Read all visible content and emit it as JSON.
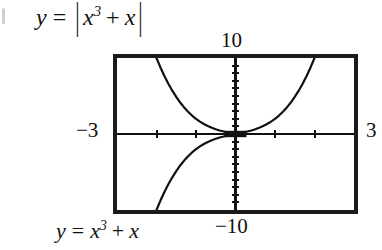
{
  "top_expression": {
    "lhs": "y",
    "equals": "=",
    "open_bar": "|",
    "base": "x",
    "exponent": "3",
    "plus": "+",
    "term": "x",
    "close_bar": "|",
    "plain": "y = |x^3 + x|"
  },
  "bottom_caption": {
    "lhs": "y",
    "equals": "=",
    "base": "x",
    "exponent": "3",
    "plus": "+",
    "term": "x",
    "plain": "y = x^3 + x"
  },
  "window": {
    "ymax_label": "10",
    "ymin_label": "−10",
    "xmin_label": "−3",
    "xmax_label": "3"
  },
  "colors": {
    "frame": "#1a1a1a",
    "axis": "#111111",
    "curve": "#111111",
    "background": "#ffffff"
  },
  "chart_data": {
    "type": "line",
    "subtitle": "y = x^3 + x",
    "xlabel": "",
    "ylabel": "",
    "xlim": [
      -3,
      3
    ],
    "ylim": [
      -10,
      10
    ],
    "grid": false,
    "legend": "none",
    "x_ticks": [
      -3,
      -2,
      -1,
      0,
      1,
      2,
      3
    ],
    "y_ticks": [
      -10,
      -9,
      -8,
      -7,
      -6,
      -5,
      -4,
      -3,
      -2,
      -1,
      0,
      1,
      2,
      3,
      4,
      5,
      6,
      7,
      8,
      9,
      10
    ],
    "x_tick_labels": [
      "−3",
      "",
      "",
      "",
      "",
      "",
      "3"
    ],
    "y_tick_labels": [
      "−10",
      "",
      "",
      "",
      "",
      "",
      "",
      "",
      "",
      "",
      "",
      "",
      "",
      "",
      "",
      "",
      "",
      "",
      "",
      "",
      "10"
    ],
    "series": [
      {
        "name": "y = |x^3 + x|",
        "style": "solid",
        "x": [
          -2.15,
          -2.1,
          -2.0,
          -1.9,
          -1.8,
          -1.7,
          -1.6,
          -1.5,
          -1.4,
          -1.3,
          -1.2,
          -1.1,
          -1.0,
          -0.9,
          -0.8,
          -0.7,
          -0.6,
          -0.5,
          -0.4,
          -0.3,
          -0.2,
          -0.1,
          0.0,
          0.1,
          0.2,
          0.3,
          0.4,
          0.5,
          0.6,
          0.7,
          0.8,
          0.9,
          1.0,
          1.1,
          1.2,
          1.3,
          1.4,
          1.5,
          1.6,
          1.7,
          1.8,
          1.9,
          2.0,
          2.1,
          2.15
        ],
        "values": [
          12.09,
          11.36,
          10.0,
          8.76,
          7.63,
          6.61,
          5.7,
          4.88,
          4.14,
          3.5,
          2.93,
          2.43,
          2.0,
          1.63,
          1.31,
          1.04,
          0.82,
          0.63,
          0.46,
          0.33,
          0.21,
          0.1,
          0.0,
          0.1,
          0.21,
          0.33,
          0.46,
          0.63,
          0.82,
          1.04,
          1.31,
          1.63,
          2.0,
          2.43,
          2.93,
          3.5,
          4.14,
          4.88,
          5.7,
          6.61,
          7.63,
          8.76,
          10.0,
          11.36,
          12.09
        ]
      },
      {
        "name": "y = x^3 + x (negative branch, x < 0)",
        "style": "solid",
        "x": [
          -2.0,
          -1.9,
          -1.8,
          -1.7,
          -1.6,
          -1.5,
          -1.4,
          -1.3,
          -1.2,
          -1.1,
          -1.0,
          -0.9,
          -0.8,
          -0.7,
          -0.6,
          -0.5,
          -0.4,
          -0.3,
          -0.2,
          -0.1,
          0.0
        ],
        "values": [
          -10.0,
          -8.76,
          -7.63,
          -6.61,
          -5.7,
          -4.88,
          -4.14,
          -3.5,
          -2.93,
          -2.43,
          -2.0,
          -1.63,
          -1.31,
          -1.04,
          -0.82,
          -0.63,
          -0.46,
          -0.33,
          -0.21,
          -0.1,
          0.0
        ]
      }
    ],
    "annotations": [
      {
        "name": "origin-marker",
        "x": 0,
        "y": 0,
        "note": "thick dark mark where curves meet the x-axis near the origin"
      }
    ]
  },
  "icons": {
    "bullet": "bullet-mark"
  }
}
